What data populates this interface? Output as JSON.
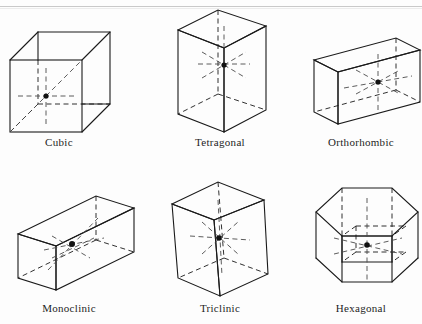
{
  "page": {
    "background_color": "#fdfdfd",
    "rule_color": "#c9c9c9",
    "line_color": "#1a1a1a",
    "dash_color": "#555555",
    "dot_color": "#111111"
  },
  "figures": [
    {
      "id": "cubic",
      "label": "Cubic",
      "shape": "cube",
      "description": "Equal-sided cube drawn in oblique projection with dashed hidden edges, dashed internal axes and a body-centre lattice point",
      "has_center_point": true,
      "axes": [
        "horizontal",
        "vertical",
        "diagonal"
      ]
    },
    {
      "id": "tetragonal",
      "label": "Tetragonal",
      "shape": "square-prism",
      "description": "Tall square prism, square base with elongated vertical axis, dashed hidden edges and body-centre lattice point",
      "has_center_point": true,
      "axes": [
        "horizontal",
        "vertical",
        "diagonal"
      ]
    },
    {
      "id": "orthorhombic",
      "label": "Orthorhombic",
      "shape": "rectangular-prism",
      "description": "Wide rectangular box with three unequal edge lengths, dashed hidden edges and body-centre lattice point",
      "has_center_point": true,
      "axes": [
        "horizontal",
        "vertical",
        "diagonal"
      ]
    },
    {
      "id": "monoclinic",
      "label": "Monoclinic",
      "shape": "oblique-prism",
      "description": "Slanted flat parallelepiped tilted up to the right, one oblique angle, dashed hidden edges and body-centre lattice point",
      "has_center_point": true,
      "axes": [
        "horizontal",
        "vertical",
        "diagonal"
      ]
    },
    {
      "id": "triclinic",
      "label": "Triclinic",
      "shape": "skewed-parallelepiped",
      "description": "Fully skewed parallelepiped with all three angles oblique, dashed hidden edges and body-centre lattice point",
      "has_center_point": true,
      "axes": [
        "horizontal",
        "vertical",
        "diagonal"
      ]
    },
    {
      "id": "hexagonal",
      "label": "Hexagonal",
      "shape": "hexagonal-prism",
      "description": "Hexagonal prism containing an inner rhombic unit cell outlined with solid and dashed edges and a centre lattice point",
      "has_center_point": true,
      "axes": [
        "horizontal",
        "vertical",
        "diagonal"
      ]
    }
  ]
}
